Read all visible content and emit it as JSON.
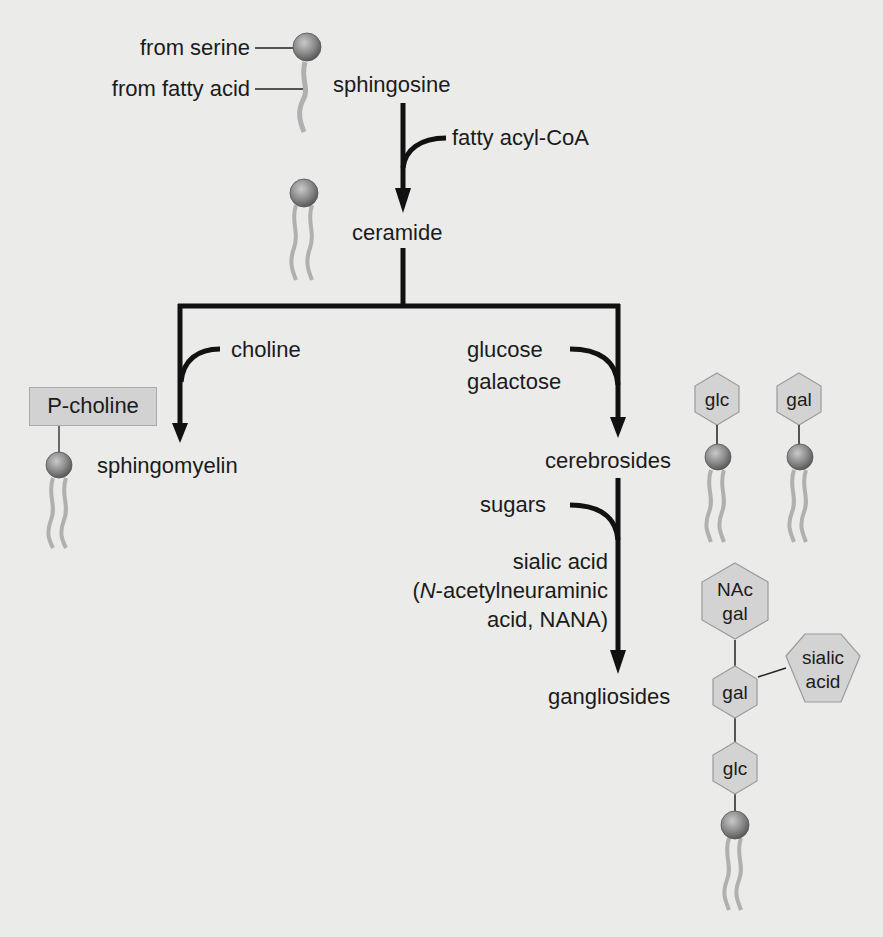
{
  "diagram": {
    "colors": {
      "background": "#ebebea",
      "arrow": "#111111",
      "head_fill": "#8a8a8a",
      "tail": "#b0b0b0",
      "hexagon_fill": "#d3d3d3",
      "hexagon_stroke": "#9b9b9b"
    },
    "nodes": {
      "sphingosine": "sphingosine",
      "ceramide": "ceramide",
      "sphingomyelin": "sphingomyelin",
      "cerebrosides": "cerebrosides",
      "gangliosides": "gangliosides"
    },
    "annotations": {
      "from_serine": "from serine",
      "from_fatty_acid": "from fatty acid"
    },
    "inputs": {
      "fatty_acyl_coa": "fatty acyl-CoA",
      "choline": "choline",
      "glucose": "glucose",
      "galactose": "galactose",
      "sugars": "sugars",
      "sialic_acid": "sialic acid",
      "nana_prefix": "(",
      "nana_italic": "N",
      "nana_line1_rest": "-acetylneuraminic",
      "nana_line2": "acid, NANA)"
    },
    "structures": {
      "p_choline": "P-choline",
      "cerebroside_glc": "glc",
      "cerebroside_gal": "gal",
      "ganglioside_nac_line1": "NAc",
      "ganglioside_nac_line2": "gal",
      "ganglioside_gal": "gal",
      "ganglioside_sialic_line1": "sialic",
      "ganglioside_sialic_line2": "acid",
      "ganglioside_glc": "glc"
    }
  }
}
